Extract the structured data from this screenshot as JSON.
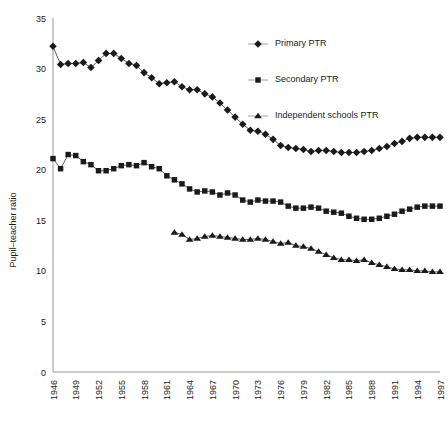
{
  "chart_data": {
    "type": "line",
    "title": "",
    "xlabel": "",
    "ylabel": "Pupil–teacher ratio",
    "ylim": [
      0,
      35
    ],
    "ytick_step": 5,
    "yticks": [
      "0",
      "5",
      "10",
      "15",
      "20",
      "25",
      "30",
      "35"
    ],
    "xlim": [
      1946,
      1997
    ],
    "xtick_step": 3,
    "xticks": [
      "1946",
      "1949",
      "1952",
      "1955",
      "1958",
      "1961",
      "1964",
      "1967",
      "1970",
      "1973",
      "1976",
      "1979",
      "1982",
      "1985",
      "1988",
      "1991",
      "1994",
      "1997"
    ],
    "grid": false,
    "legend_position": "top-right",
    "x": [
      1946,
      1947,
      1948,
      1949,
      1950,
      1951,
      1952,
      1953,
      1954,
      1955,
      1956,
      1957,
      1958,
      1959,
      1960,
      1961,
      1962,
      1963,
      1964,
      1965,
      1966,
      1967,
      1968,
      1969,
      1970,
      1971,
      1972,
      1973,
      1974,
      1975,
      1976,
      1977,
      1978,
      1979,
      1980,
      1981,
      1982,
      1983,
      1984,
      1985,
      1986,
      1987,
      1988,
      1989,
      1990,
      1991,
      1992,
      1993,
      1994,
      1995,
      1996,
      1997
    ],
    "series": [
      {
        "name": "Primary PTR",
        "marker": "diamond",
        "x": [
          1946,
          1947,
          1948,
          1949,
          1950,
          1951,
          1952,
          1953,
          1954,
          1955,
          1956,
          1957,
          1958,
          1959,
          1960,
          1961,
          1962,
          1963,
          1964,
          1965,
          1966,
          1967,
          1968,
          1969,
          1970,
          1971,
          1972,
          1973,
          1974,
          1975,
          1976,
          1977,
          1978,
          1979,
          1980,
          1981,
          1982,
          1983,
          1984,
          1985,
          1986,
          1987,
          1988,
          1989,
          1990,
          1991,
          1992,
          1993,
          1994,
          1995,
          1996,
          1997
        ],
        "values": [
          32.2,
          30.4,
          30.5,
          30.5,
          30.6,
          30.1,
          30.8,
          31.5,
          31.5,
          31.0,
          30.5,
          30.3,
          29.6,
          29.1,
          28.5,
          28.6,
          28.7,
          28.2,
          27.9,
          27.9,
          27.5,
          27.2,
          26.6,
          25.9,
          25.2,
          24.5,
          23.9,
          23.8,
          23.5,
          23.0,
          22.4,
          22.2,
          22.1,
          22.0,
          21.8,
          21.9,
          21.9,
          21.8,
          21.7,
          21.7,
          21.7,
          21.8,
          21.9,
          22.1,
          22.3,
          22.6,
          22.8,
          23.1,
          23.2,
          23.2,
          23.2,
          23.2
        ]
      },
      {
        "name": "Secondary PTR",
        "marker": "square",
        "x": [
          1946,
          1947,
          1948,
          1949,
          1950,
          1951,
          1952,
          1953,
          1954,
          1955,
          1956,
          1957,
          1958,
          1959,
          1960,
          1961,
          1962,
          1963,
          1964,
          1965,
          1966,
          1967,
          1968,
          1969,
          1970,
          1971,
          1972,
          1973,
          1974,
          1975,
          1976,
          1977,
          1978,
          1979,
          1980,
          1981,
          1982,
          1983,
          1984,
          1985,
          1986,
          1987,
          1988,
          1989,
          1990,
          1991,
          1992,
          1993,
          1994,
          1995,
          1996,
          1997
        ],
        "values": [
          21.1,
          20.1,
          21.5,
          21.4,
          20.8,
          20.5,
          19.9,
          19.9,
          20.1,
          20.4,
          20.5,
          20.4,
          20.7,
          20.3,
          20.1,
          19.4,
          19.0,
          18.6,
          18.1,
          17.8,
          17.9,
          17.8,
          17.5,
          17.7,
          17.5,
          17.0,
          16.8,
          17.0,
          16.9,
          16.9,
          16.8,
          16.4,
          16.2,
          16.2,
          16.3,
          16.2,
          15.9,
          15.8,
          15.7,
          15.4,
          15.2,
          15.1,
          15.1,
          15.2,
          15.4,
          15.6,
          15.9,
          16.1,
          16.3,
          16.4,
          16.4,
          16.4
        ]
      },
      {
        "name": "Independent schools PTR",
        "marker": "triangle",
        "x": [
          1962,
          1963,
          1964,
          1965,
          1966,
          1967,
          1968,
          1969,
          1970,
          1971,
          1972,
          1973,
          1974,
          1975,
          1976,
          1977,
          1978,
          1979,
          1980,
          1981,
          1982,
          1983,
          1984,
          1985,
          1986,
          1987,
          1988,
          1989,
          1990,
          1991,
          1992,
          1993,
          1994,
          1995,
          1996,
          1997
        ],
        "values": [
          13.8,
          13.6,
          13.1,
          13.2,
          13.4,
          13.5,
          13.4,
          13.3,
          13.2,
          13.1,
          13.1,
          13.2,
          13.1,
          12.9,
          12.7,
          12.8,
          12.5,
          12.4,
          12.2,
          11.9,
          11.6,
          11.3,
          11.1,
          11.1,
          11.0,
          11.1,
          10.8,
          10.6,
          10.4,
          10.2,
          10.1,
          10.1,
          10.0,
          10.0,
          9.9,
          9.9
        ]
      }
    ]
  },
  "legend": {
    "items": [
      {
        "label": "Primary PTR",
        "marker": "diamond"
      },
      {
        "label": "Secondary PTR",
        "marker": "square"
      },
      {
        "label": "Independent schools PTR",
        "marker": "triangle"
      }
    ]
  },
  "colors": {
    "marker": "#1a1a1a",
    "axis": "#9a9a9a",
    "text": "#1a1a1a",
    "background": "#ffffff"
  }
}
